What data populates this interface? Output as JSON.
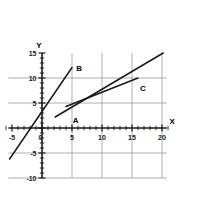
{
  "chart_data": {
    "type": "line",
    "title": "",
    "xlabel": "X",
    "ylabel": "Y",
    "xlim": [
      -6,
      21
    ],
    "ylim": [
      -10,
      15
    ],
    "grid": true,
    "legend": "none",
    "xticks": [
      -5,
      0,
      5,
      10,
      15,
      20
    ],
    "yticks": [
      -10,
      -5,
      0,
      5,
      10,
      15
    ],
    "xtick_labels": [
      "-5",
      "0",
      "5",
      "10",
      "15",
      "20"
    ],
    "ytick_labels": [
      "-10",
      "-5",
      "0",
      "5",
      "10",
      "15"
    ],
    "gridlines_x": [
      5,
      10,
      15,
      20
    ],
    "gridlines_y": [
      -10,
      -5,
      5,
      10
    ],
    "minor_tick_step": 1,
    "series": [
      {
        "name": "B",
        "label": "B",
        "label_x": 6.2,
        "label_y": 12.6,
        "x": [
          -5.4,
          5.0
        ],
        "y": [
          -6.2,
          12.1
        ],
        "slope": 1.76,
        "intercept": 3.3,
        "color": "#1a1a1a"
      },
      {
        "name": "A",
        "label": "A",
        "label_x": 5.6,
        "label_y": 2.3,
        "x": [
          2.2,
          20.2
        ],
        "y": [
          2.2,
          15.0
        ],
        "slope": 0.71,
        "intercept": 0.64,
        "color": "#1a1a1a"
      },
      {
        "name": "C",
        "label": "C",
        "label_x": 16.8,
        "label_y": 8.6,
        "x": [
          4.0,
          16.0
        ],
        "y": [
          4.3,
          10.0
        ],
        "slope": 0.475,
        "intercept": 2.4,
        "color": "#1a1a1a"
      }
    ],
    "axis_color": "#1a1a1a",
    "grid_color": "#9a9a9a",
    "background": "#ffffff"
  }
}
